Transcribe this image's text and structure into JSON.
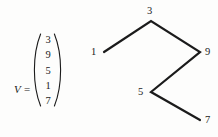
{
  "figure": {
    "background_color": "#fdfdfc",
    "ink_color": "#1b1b1b"
  },
  "vector": {
    "name": "V",
    "equals_sign": "=",
    "entries": [
      "3",
      "9",
      "5",
      "1",
      "7"
    ],
    "bracket_style": "parentheses"
  },
  "chart_data": {
    "type": "line",
    "title": "",
    "xlabel": "",
    "ylabel": "",
    "grid": false,
    "legend": null,
    "axis_visible": false,
    "categories": [
      "1",
      "2",
      "3",
      "4",
      "5"
    ],
    "values": [
      1,
      3,
      9,
      5,
      7
    ],
    "point_labels": [
      "1",
      "3",
      "9",
      "5",
      "7"
    ],
    "points": [
      {
        "label": "1",
        "x": 19,
        "y": 52,
        "label_x": 6,
        "label_y": 46
      },
      {
        "label": "3",
        "x": 66,
        "y": 21,
        "label_x": 62,
        "label_y": 5
      },
      {
        "label": "9",
        "x": 115,
        "y": 52,
        "label_x": 120,
        "label_y": 46
      },
      {
        "label": "5",
        "x": 66,
        "y": 92,
        "label_x": 53,
        "label_y": 86
      },
      {
        "label": "7",
        "x": 115,
        "y": 120,
        "label_x": 120,
        "label_y": 114
      }
    ],
    "path": "M19,52 L66,21 L115,52 L66,92 L115,120",
    "line_color": "#1b1b1b",
    "line_width": 2.2
  }
}
